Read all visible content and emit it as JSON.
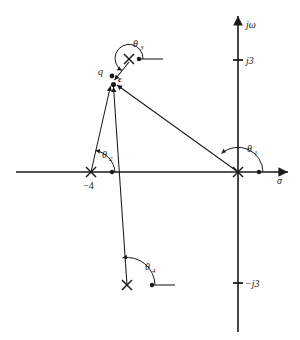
{
  "figure": {
    "background_color": "#ffffff",
    "ink_color": "#1a1a1a"
  },
  "axes": {
    "real_axis": {
      "name": "sigma-axis",
      "label": "σ",
      "label_x": 276,
      "label_y": 183,
      "x1": 16,
      "x2": 290,
      "y": 172
    },
    "imag_axis": {
      "name": "jomega-axis",
      "label": "jω",
      "label_x": 246,
      "label_y": 27,
      "x": 238,
      "y1": 14,
      "y2": 332
    },
    "origin": {
      "x": 238,
      "y": 172
    }
  },
  "ticks": [
    {
      "name": "tick-j3",
      "label": "j3",
      "x": 238,
      "y": 60,
      "label_x": 246,
      "label_y": 64
    },
    {
      "name": "tick-minus-j3",
      "label": "−j3",
      "x": 238,
      "y": 283,
      "label_x": 246,
      "label_y": 287
    }
  ],
  "poles": [
    {
      "name": "pole-origin",
      "label": "",
      "x": 238,
      "y": 172
    },
    {
      "name": "pole-minus-4",
      "label": "−4",
      "x": 91,
      "y": 172,
      "label_x": 84,
      "label_y": 188
    },
    {
      "name": "pole-upper-complex",
      "label": "",
      "x": 129,
      "y": 59
    },
    {
      "name": "pole-lower-complex",
      "label": "",
      "x": 127,
      "y": 285
    }
  ],
  "test_point": {
    "name": "test-point-q",
    "label": "q",
    "label_x": 99,
    "label_y": 74,
    "x": 113,
    "y": 84,
    "epsilon_label": "ε",
    "epsilon_label_x": 119,
    "epsilon_label_y": 80,
    "epsilon_dot_x": 112,
    "epsilon_dot_y": 76
  },
  "angles": [
    {
      "name": "angle-theta-1",
      "label": "θ",
      "subscript": "1",
      "label_x": 249,
      "label_y": 150,
      "vertex_x": 238,
      "vertex_y": 172,
      "ref_dot_x": 259,
      "ref_dot_y": 172,
      "ray_to_x": 113,
      "ray_to_y": 84
    },
    {
      "name": "angle-theta-2",
      "label": "θ",
      "subscript": "2",
      "label_x": 104,
      "label_y": 157,
      "vertex_x": 91,
      "vertex_y": 172,
      "ref_dot_x": 112,
      "ref_dot_y": 172,
      "ray_to_x": 113,
      "ray_to_y": 84
    },
    {
      "name": "angle-theta-3",
      "label": "θ",
      "subscript": "3",
      "label_x": 135,
      "label_y": 46,
      "vertex_x": 129,
      "vertex_y": 59,
      "ref_dot_x": 139,
      "ref_dot_y": 59,
      "ref_line_to_x": 163,
      "ray_to_x": 115,
      "ray_to_y": 76
    },
    {
      "name": "angle-theta-4",
      "label": "θ",
      "subscript": "4",
      "label_x": 147,
      "label_y": 269,
      "vertex_x": 127,
      "vertex_y": 285,
      "ref_dot_x": 152,
      "ref_dot_y": 285,
      "ref_line_to_x": 175,
      "ray_to_x": 117,
      "ray_to_y": 262
    }
  ],
  "vectors": [
    {
      "name": "vector-from-origin",
      "from_x": 238,
      "from_y": 172,
      "to_x": 115,
      "to_y": 84
    },
    {
      "name": "vector-from-minus-4",
      "from_x": 91,
      "from_y": 172,
      "to_x": 110,
      "to_y": 84
    },
    {
      "name": "vector-from-lower-pole",
      "from_x": 127,
      "from_y": 285,
      "to_x": 113,
      "to_y": 84
    },
    {
      "name": "vector-from-upper-pole",
      "from_x": 129,
      "from_y": 62,
      "to_x": 114,
      "to_y": 81
    }
  ]
}
